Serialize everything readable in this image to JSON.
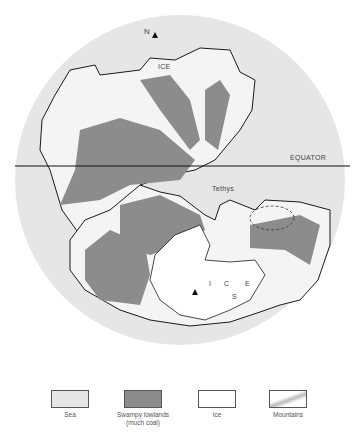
{
  "map": {
    "type": "paleogeographic-globe",
    "labels": {
      "north": "N",
      "south": "S",
      "ice_north": "ICE",
      "ice_south_i": "I",
      "ice_south_c": "C",
      "ice_south_e": "E",
      "equator": "EQUATOR",
      "tethys": "Tethys"
    },
    "colors": {
      "sea": "#e6e6e6",
      "swampy_lowlands": "#8c8c8c",
      "ice": "#ffffff",
      "mountains": "#c8c8c8",
      "outline": "#1a1a1a"
    }
  },
  "legend": {
    "items": [
      {
        "label": "Sea",
        "sublabel": ""
      },
      {
        "label": "Swampy lowlands",
        "sublabel": "(much coal)"
      },
      {
        "label": "Ice",
        "sublabel": ""
      },
      {
        "label": "Mountains",
        "sublabel": ""
      }
    ]
  }
}
